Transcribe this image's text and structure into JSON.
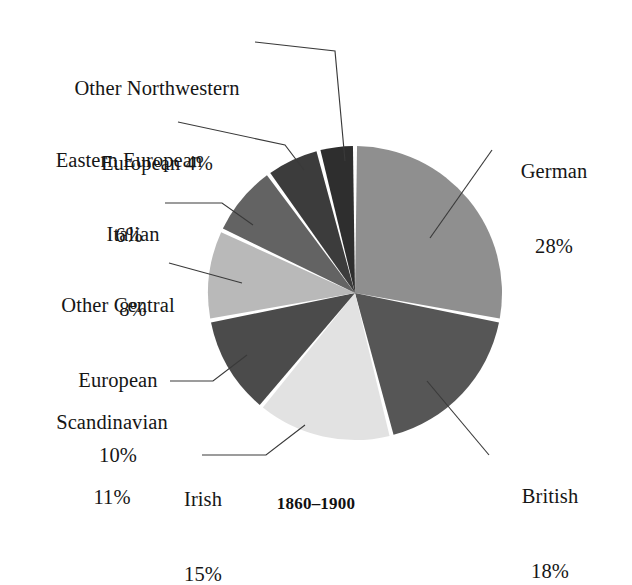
{
  "chart_data": {
    "type": "pie",
    "title": "",
    "caption": "1860–1900",
    "total_label_suffix": "%",
    "start_angle_deg": 0,
    "direction": "clockwise",
    "center": {
      "x": 355,
      "y": 293
    },
    "radius": 147,
    "slice_gap_deg": 1.6,
    "categories": [
      "German",
      "British",
      "Irish",
      "Scandinavian",
      "Other Central European",
      "Italian",
      "Eastern European",
      "Other Northwestern European"
    ],
    "values": [
      28,
      18,
      15,
      11,
      10,
      8,
      6,
      4
    ],
    "value_labels": [
      "28%",
      "18%",
      "15%",
      "11%",
      "10%",
      "8%",
      "6%",
      "4%"
    ],
    "colors": [
      "#8f8f8f",
      "#565656",
      "#e2e2e2",
      "#4b4b4b",
      "#b9b9b9",
      "#636363",
      "#3c3c3c",
      "#2e2e2e"
    ],
    "legend_position": "callout-labels",
    "grid": false
  },
  "labels": [
    {
      "id": "other-northwestern-european",
      "lines": [
        "Other Northwestern",
        "European 4%"
      ],
      "value": "4%"
    },
    {
      "id": "eastern-european",
      "lines": [
        "Eastern European",
        "6%"
      ],
      "value": "6%"
    },
    {
      "id": "italian",
      "lines": [
        "Italian",
        "8%"
      ],
      "value": "8%"
    },
    {
      "id": "other-central-european",
      "lines": [
        "Other Central",
        "European",
        "10%"
      ],
      "value": "10%"
    },
    {
      "id": "scandinavian",
      "lines": [
        "Scandinavian",
        "11%"
      ],
      "value": "11%"
    },
    {
      "id": "irish",
      "lines": [
        "Irish",
        "15%"
      ],
      "value": "15%"
    },
    {
      "id": "german",
      "lines": [
        "German",
        "28%"
      ],
      "value": "28%"
    },
    {
      "id": "british",
      "lines": [
        "British",
        "18%"
      ],
      "value": "18%"
    }
  ],
  "caption": "1860–1900",
  "style": {
    "background": "#ffffff",
    "text_color": "#161616",
    "leader_line_color": "#3a3a3a",
    "slice_separator_color": "#ffffff"
  }
}
